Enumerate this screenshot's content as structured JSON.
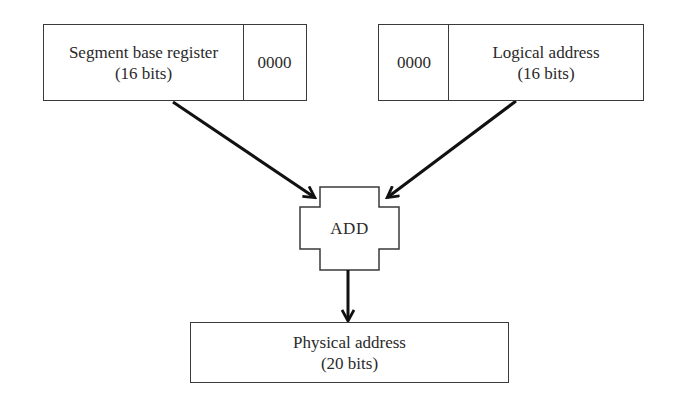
{
  "diagram": {
    "segment_register": {
      "label_line1": "Segment base register",
      "label_line2": "(16 bits)",
      "padding_bits": "0000"
    },
    "logical_address": {
      "padding_bits": "0000",
      "label_line1": "Logical address",
      "label_line2": "(16 bits)"
    },
    "adder": {
      "label": "ADD"
    },
    "physical_address": {
      "label_line1": "Physical address",
      "label_line2": "(20 bits)"
    },
    "connections": [
      {
        "from": "segment_register",
        "to": "adder"
      },
      {
        "from": "logical_address",
        "to": "adder"
      },
      {
        "from": "adder",
        "to": "physical_address"
      }
    ],
    "colors": {
      "stroke": "#3a3a3a",
      "arrow": "#111111",
      "text": "#2a2a2a",
      "background": "#ffffff"
    }
  }
}
